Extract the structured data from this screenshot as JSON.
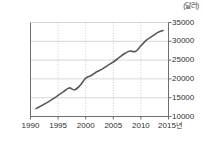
{
  "chart_data": {
    "type": "line",
    "title": "",
    "subtitle": "",
    "xlabel": "",
    "ylabel": "",
    "unit_label": "(달러)",
    "x_axis_suffix": "년",
    "xlim": [
      1990,
      2015
    ],
    "ylim": [
      10000,
      35000
    ],
    "xticks": [
      1990,
      1995,
      2000,
      2005,
      2010,
      2015
    ],
    "xtick_labels": [
      "1990",
      "1995",
      "2000",
      "2005",
      "2010",
      "2015"
    ],
    "yticks": [
      10000,
      15000,
      20000,
      25000,
      30000,
      35000
    ],
    "ytick_labels": [
      "10000",
      "15000",
      "20000",
      "25000",
      "30000",
      "35000"
    ],
    "grid": true,
    "grid_x_style": "dotted",
    "grid_y_style": "solid",
    "legend": false,
    "legend_position": "none",
    "line_color": "#595959",
    "grid_color": "#d8d8d8",
    "axis_color": "#6e6e6e",
    "series": [
      {
        "name": "1인당 국민소득",
        "x": [
          1991,
          1992,
          1993,
          1994,
          1995,
          1996,
          1997,
          1998,
          1999,
          2000,
          2001,
          2002,
          2003,
          2004,
          2005,
          2006,
          2007,
          2008,
          2009,
          2010,
          2011,
          2012,
          2013,
          2014
        ],
        "values": [
          12100,
          12900,
          13700,
          14600,
          15600,
          16600,
          17600,
          17100,
          18300,
          20200,
          20900,
          21900,
          22600,
          23600,
          24500,
          25600,
          26700,
          27400,
          27300,
          28800,
          30300,
          31300,
          32300,
          32900
        ]
      }
    ]
  }
}
